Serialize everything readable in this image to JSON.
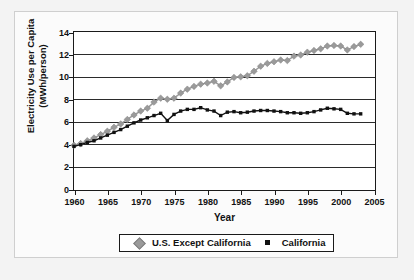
{
  "chart_data": {
    "type": "line",
    "title": "",
    "xlabel": "Year",
    "ylabel": "Electricity Use per Capita (MWh/person)",
    "ylabel_line1": "Electricity Use per Capita",
    "ylabel_line2": "(MWh/person)",
    "xlim": [
      1960,
      2005
    ],
    "ylim": [
      0,
      14
    ],
    "xticks": [
      1960,
      1965,
      1970,
      1975,
      1980,
      1985,
      1990,
      1995,
      2000,
      2005
    ],
    "yticks": [
      0,
      2,
      4,
      6,
      8,
      10,
      12,
      14
    ],
    "grid": "horizontal",
    "legend_position": "bottom-center",
    "x": [
      1960,
      1961,
      1962,
      1963,
      1964,
      1965,
      1966,
      1967,
      1968,
      1969,
      1970,
      1971,
      1972,
      1973,
      1974,
      1975,
      1976,
      1977,
      1978,
      1979,
      1980,
      1981,
      1982,
      1983,
      1984,
      1985,
      1986,
      1987,
      1988,
      1989,
      1990,
      1991,
      1992,
      1993,
      1994,
      1995,
      1996,
      1997,
      1998,
      1999,
      2000,
      2001,
      2002,
      2003
    ],
    "series": [
      {
        "name": "U.S. Except California",
        "color": "#9a9a9a",
        "marker": "diamond",
        "values": [
          3.9,
          4.05,
          4.3,
          4.55,
          4.85,
          5.15,
          5.5,
          5.8,
          6.2,
          6.6,
          6.95,
          7.2,
          7.75,
          8.1,
          8.0,
          8.1,
          8.55,
          8.9,
          9.15,
          9.35,
          9.45,
          9.6,
          9.2,
          9.55,
          9.95,
          10.0,
          10.1,
          10.5,
          10.95,
          11.2,
          11.35,
          11.5,
          11.45,
          11.85,
          11.95,
          12.2,
          12.35,
          12.5,
          12.75,
          12.8,
          12.75,
          12.4,
          12.7,
          12.9
        ]
      },
      {
        "name": "California",
        "color": "#111111",
        "marker": "square",
        "values": [
          3.8,
          3.95,
          4.15,
          4.3,
          4.55,
          4.8,
          5.05,
          5.3,
          5.6,
          5.9,
          6.15,
          6.35,
          6.55,
          6.75,
          6.1,
          6.65,
          6.95,
          7.1,
          7.1,
          7.25,
          7.05,
          6.95,
          6.55,
          6.85,
          6.9,
          6.8,
          6.85,
          6.95,
          7.0,
          7.0,
          6.95,
          6.9,
          6.8,
          6.8,
          6.75,
          6.8,
          6.9,
          7.05,
          7.2,
          7.15,
          7.1,
          6.75,
          6.7,
          6.7
        ]
      }
    ]
  },
  "legend": {
    "entries": [
      {
        "label": "U.S. Except California"
      },
      {
        "label": "California"
      }
    ]
  }
}
